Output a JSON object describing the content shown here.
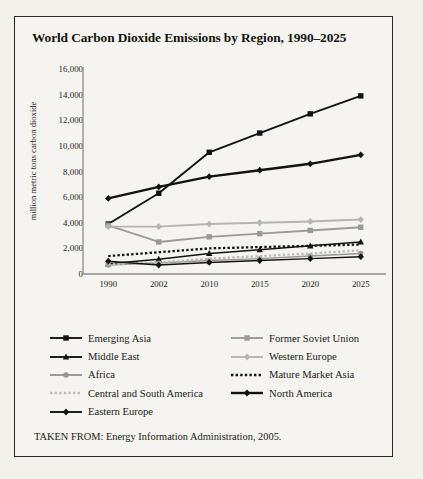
{
  "figure": {
    "title": "World Carbon Dioxide Emissions by Region, 1990–2025",
    "source_note": "TAKEN FROM: Energy Information Administration, 2005."
  },
  "chart_data": {
    "type": "line",
    "title": "World Carbon Dioxide Emissions by Region, 1990–2025",
    "xlabel": "",
    "ylabel": "million metric tons carbon dioxide",
    "categories": [
      "1990",
      "2002",
      "2010",
      "2015",
      "2020",
      "2025"
    ],
    "ylim": [
      0,
      16000
    ],
    "yticks": [
      "0",
      "2,000",
      "4,000",
      "6,000",
      "8,000",
      "10,000",
      "12,000",
      "14,000",
      "16,000"
    ],
    "ytick_values": [
      0,
      2000,
      4000,
      6000,
      8000,
      10000,
      12000,
      14000,
      16000
    ],
    "grid": false,
    "legend_position": "below-plot",
    "series": [
      {
        "name": "Emerging Asia",
        "marker": "square",
        "color": "#121210",
        "dashed": false,
        "width": 1.9,
        "values": [
          3900,
          6300,
          9500,
          11000,
          12500,
          13900
        ]
      },
      {
        "name": "Former Soviet Union",
        "marker": "square",
        "color": "#9a9a98",
        "dashed": false,
        "width": 1.9,
        "values": [
          3800,
          2500,
          2900,
          3150,
          3400,
          3650
        ]
      },
      {
        "name": "Middle East",
        "marker": "triangle",
        "color": "#131311",
        "dashed": false,
        "width": 1.5,
        "values": [
          800,
          1150,
          1600,
          1900,
          2200,
          2500
        ]
      },
      {
        "name": "Western Europe",
        "marker": "diamond",
        "color": "#b4b4b2",
        "dashed": false,
        "width": 1.9,
        "values": [
          3700,
          3700,
          3900,
          4000,
          4100,
          4250
        ]
      },
      {
        "name": "Africa",
        "marker": "circle",
        "color": "#969694",
        "dashed": false,
        "width": 1.5,
        "values": [
          700,
          850,
          1050,
          1200,
          1400,
          1600
        ]
      },
      {
        "name": "Mature Market Asia",
        "marker": "none",
        "color": "#121210",
        "dashed": true,
        "width": 2.3,
        "values": [
          1400,
          1700,
          2000,
          2100,
          2200,
          2300
        ]
      },
      {
        "name": "Central and South America",
        "marker": "none",
        "color": "#bcbcba",
        "dashed": true,
        "width": 2.3,
        "values": [
          750,
          900,
          1200,
          1400,
          1600,
          1850
        ]
      },
      {
        "name": "North America",
        "marker": "diamond",
        "color": "#111110",
        "dashed": false,
        "width": 2.4,
        "values": [
          5900,
          6800,
          7600,
          8100,
          8600,
          9300
        ]
      },
      {
        "name": "Eastern Europe",
        "marker": "diamond",
        "color": "#121210",
        "dashed": false,
        "width": 1.5,
        "values": [
          1000,
          700,
          900,
          1050,
          1200,
          1350
        ]
      }
    ],
    "legend": [
      {
        "label": "Emerging Asia",
        "column": "left",
        "marker": "square",
        "color": "#121210",
        "dashed": false
      },
      {
        "label": "Middle East",
        "column": "left",
        "marker": "triangle",
        "color": "#131311",
        "dashed": false
      },
      {
        "label": "Africa",
        "column": "left",
        "marker": "circle",
        "color": "#969694",
        "dashed": false
      },
      {
        "label": "Central and South America",
        "column": "left",
        "marker": "none",
        "color": "#bcbcba",
        "dashed": true
      },
      {
        "label": "Eastern Europe",
        "column": "left",
        "marker": "diamond",
        "color": "#121210",
        "dashed": false
      },
      {
        "label": "Former Soviet Union",
        "column": "right",
        "marker": "square",
        "color": "#9a9a98",
        "dashed": false
      },
      {
        "label": "Western Europe",
        "column": "right",
        "marker": "diamond",
        "color": "#b4b4b2",
        "dashed": false
      },
      {
        "label": "Mature Market Asia",
        "column": "right",
        "marker": "none",
        "color": "#121210",
        "dashed": true
      },
      {
        "label": "North America",
        "column": "right",
        "marker": "diamond",
        "color": "#111110",
        "dashed": false
      }
    ]
  }
}
